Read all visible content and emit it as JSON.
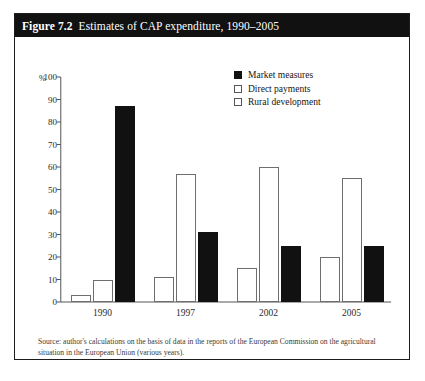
{
  "figure": {
    "number": "Figure 7.2",
    "caption": "Estimates of CAP expenditure, 1990–2005",
    "source": "Source: author's calculations on the basis of data in the reports of the European Commission on the agricultural situation in the European Union (various years)."
  },
  "chart_data": {
    "type": "bar",
    "title": "Estimates of CAP expenditure, 1990–2005",
    "xlabel": "",
    "ylabel": "%",
    "ylim": [
      0,
      100
    ],
    "yticks": [
      0,
      10,
      20,
      30,
      40,
      50,
      60,
      70,
      80,
      90,
      100
    ],
    "grid": false,
    "legend_position": "top-right",
    "categories": [
      "1990",
      "1997",
      "2002",
      "2005"
    ],
    "series": [
      {
        "name": "Market measures",
        "color": "#111111",
        "fill": "solid",
        "values": [
          87,
          31,
          25,
          25
        ]
      },
      {
        "name": "Direct payments",
        "color": "#ffffff",
        "fill": "hollow",
        "values": [
          10,
          57,
          60,
          55
        ]
      },
      {
        "name": "Rural development",
        "color": "#ffffff",
        "fill": "hollow",
        "values": [
          3,
          11,
          15,
          20
        ]
      }
    ],
    "bar_order_per_group": [
      [
        "Rural development",
        "Direct payments",
        "Market measures"
      ],
      [
        "Rural development",
        "Direct payments",
        "Market measures"
      ],
      [
        "Rural development",
        "Direct payments",
        "Market measures"
      ],
      [
        "Rural development",
        "Direct payments",
        "Market measures"
      ]
    ]
  }
}
